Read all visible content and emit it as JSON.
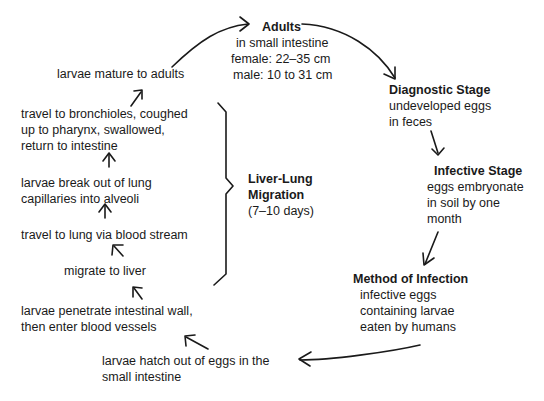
{
  "diagram": {
    "stages": {
      "adults": {
        "title": "Adults",
        "lines": [
          "in small intestine",
          "female: 22–35 cm",
          "male: 10 to 31 cm"
        ]
      },
      "diagnostic": {
        "title": "Diagnostic Stage",
        "lines": [
          "undeveloped eggs",
          "in feces"
        ]
      },
      "infective": {
        "title": "Infective Stage",
        "lines": [
          "eggs embryonate",
          "in soil by one",
          "month"
        ]
      },
      "method": {
        "title": "Method of Infection",
        "lines": [
          "infective eggs",
          "containing larvae",
          "eaten by humans"
        ]
      },
      "hatch": {
        "lines": [
          "larvae hatch out of eggs in the",
          "small intestine"
        ]
      },
      "penetrate": {
        "lines": [
          "larvae penetrate intestinal wall,",
          "then enter blood vessels"
        ]
      },
      "liver": {
        "lines": [
          "migrate to liver"
        ]
      },
      "lung": {
        "lines": [
          "travel to lung via blood stream"
        ]
      },
      "alveoli": {
        "lines": [
          "larvae break out of lung",
          "capillaries into alveoli"
        ]
      },
      "bronchioles": {
        "lines": [
          "travel to bronchioles, coughed",
          "up to pharynx, swallowed,",
          "return to intestine"
        ]
      },
      "mature": {
        "lines": [
          "larvae mature to adults"
        ]
      }
    },
    "migration": {
      "title_lines": [
        "Liver-Lung",
        "Migration"
      ],
      "duration": "(7–10 days)"
    }
  }
}
